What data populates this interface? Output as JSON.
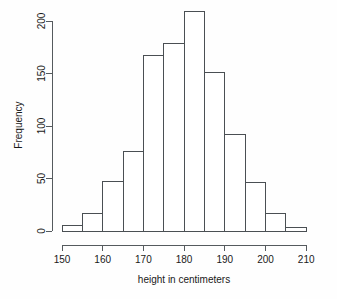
{
  "chart_data": {
    "type": "bar",
    "title": "",
    "subtitle": "",
    "xlabel": "height in centimeters",
    "ylabel": "Frequency",
    "categories": [
      "150-155",
      "155-160",
      "160-165",
      "165-170",
      "170-175",
      "175-180",
      "180-185",
      "185-190",
      "190-195",
      "195-200",
      "200-205",
      "205-210"
    ],
    "bin_edges": [
      150,
      155,
      160,
      165,
      170,
      175,
      180,
      185,
      190,
      195,
      200,
      205,
      210
    ],
    "bin_width": 5,
    "values": [
      5,
      17,
      47,
      76,
      167,
      179,
      209,
      151,
      92,
      46,
      17,
      3
    ],
    "xlim": [
      148,
      215
    ],
    "ylim": [
      0,
      209
    ],
    "xticks": [
      150,
      160,
      170,
      180,
      190,
      200,
      210
    ],
    "yticks": [
      0,
      50,
      100,
      150,
      200
    ],
    "xtick_labels": [
      "150",
      "160",
      "170",
      "180",
      "190",
      "200",
      "210"
    ],
    "ytick_labels": [
      "0",
      "50",
      "100",
      "150",
      "200"
    ],
    "grid": false,
    "legend": null,
    "bar_fill": "#ffffff",
    "bar_stroke": "#4a4f53",
    "axis_color": "#555a5e"
  }
}
